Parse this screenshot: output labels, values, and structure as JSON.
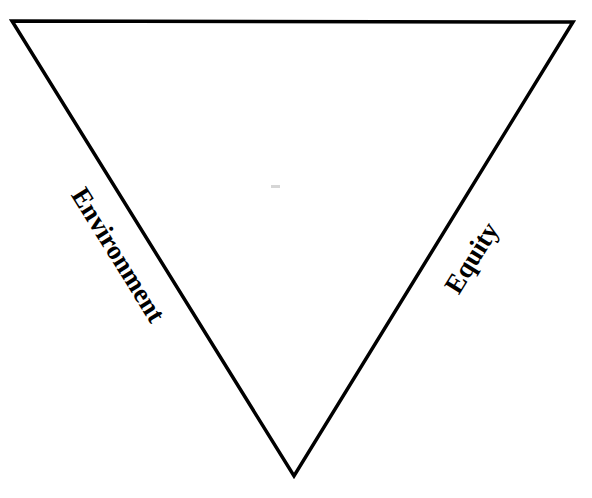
{
  "diagram": {
    "shape": "inverted-triangle",
    "vertices": {
      "top_left": [
        12,
        21
      ],
      "top_right": [
        573,
        22
      ],
      "bottom": [
        294,
        476
      ]
    },
    "stroke_color": "#000000",
    "fill_color": "#ffffff",
    "labels": {
      "left_side": "Environment",
      "right_side": "Equity"
    }
  }
}
